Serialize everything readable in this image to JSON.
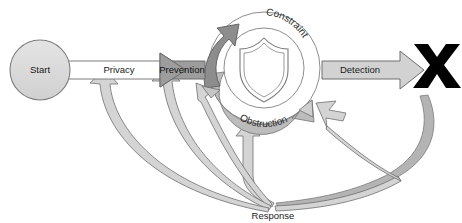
{
  "diagram": {
    "nodes": {
      "start": {
        "label": "Start"
      },
      "prevention": {
        "label": "Prevention"
      },
      "terminator": {
        "label": "blocked-x-mark"
      }
    },
    "flow_arrows": {
      "privacy": {
        "label": "Privacy"
      },
      "detection": {
        "label": "Detection"
      }
    },
    "ring": {
      "outer_label": "Constraint",
      "lower_label": "Obstruction",
      "center_icon": "shield-icon"
    },
    "feedback": {
      "label": "Response"
    }
  },
  "colors": {
    "fill_light": "#d8d8d8",
    "fill_mid": "#bfbfbf",
    "fill_dark": "#8a8a8a",
    "fill_white": "#ffffff",
    "stroke": "#6e6e6e",
    "stroke_dark": "#4a4a4a",
    "black": "#000000"
  }
}
